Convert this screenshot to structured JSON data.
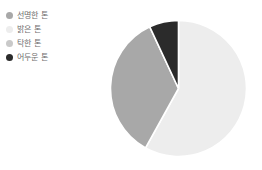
{
  "chart_data": {
    "type": "pie",
    "title": "",
    "subtitle": "",
    "xlabel": "",
    "ylabel": "",
    "grid": false,
    "legend_position": "top-left",
    "start_angle_deg": 0,
    "direction": "clockwise",
    "categories": [
      "선명한 톤",
      "밝은 톤",
      "탁한 톤",
      "어두운 톤"
    ],
    "values": [
      35,
      58,
      0,
      7
    ],
    "colors": [
      "#a8a8a8",
      "#ededed",
      "#c9c9c9",
      "#2b2b2b"
    ],
    "slices": [
      {
        "label": "밝은 톤",
        "value": 58,
        "color": "#ededed",
        "start_deg": 0,
        "end_deg": 209
      },
      {
        "label": "선명한 톤",
        "value": 35,
        "color": "#a8a8a8",
        "start_deg": 209,
        "end_deg": 335
      },
      {
        "label": "어두운 톤",
        "value": 7,
        "color": "#2b2b2b",
        "start_deg": 335,
        "end_deg": 360
      },
      {
        "label": "탁한 톤",
        "value": 0,
        "color": "#c9c9c9",
        "start_deg": 360,
        "end_deg": 360
      }
    ],
    "annotations": []
  },
  "legend": {
    "items": [
      {
        "label": "선명한 톤",
        "color": "#a8a8a8"
      },
      {
        "label": "밝은 톤",
        "color": "#ededed"
      },
      {
        "label": "탁한 톤",
        "color": "#c9c9c9"
      },
      {
        "label": "어두운 톤",
        "color": "#2b2b2b"
      }
    ]
  },
  "style": {
    "background": "#ffffff",
    "label_color": "#6e6e6e",
    "slice_border": "#ffffff"
  }
}
